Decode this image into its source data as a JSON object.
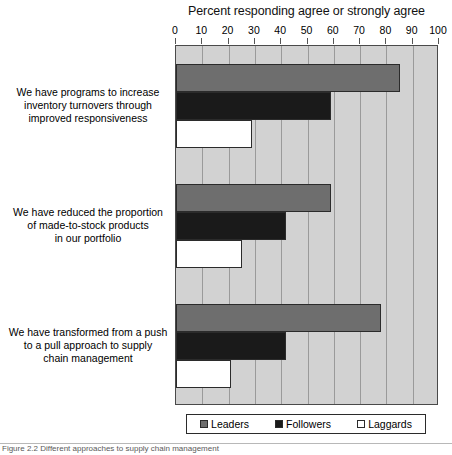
{
  "chart_data": {
    "type": "bar",
    "orientation": "horizontal",
    "title": "Percent responding agree or strongly agree",
    "xlabel": "",
    "ylabel": "",
    "xlim": [
      0,
      100
    ],
    "xticks": [
      0,
      10,
      20,
      30,
      40,
      50,
      60,
      70,
      80,
      90,
      100
    ],
    "grid": true,
    "legend_position": "bottom",
    "categories": [
      "We have programs to increase inventory turnovers through improved responsiveness",
      "We have reduced the proportion of made-to-stock products in our portfolio",
      "We have transformed from a push to a pull approach to supply chain management"
    ],
    "series": [
      {
        "name": "Leaders",
        "color": "#6e6e6e",
        "values": [
          85,
          59,
          78
        ]
      },
      {
        "name": "Followers",
        "color": "#1a1a1a",
        "values": [
          59,
          42,
          42
        ]
      },
      {
        "name": "Laggards",
        "color": "#ffffff",
        "values": [
          29,
          25,
          21
        ]
      }
    ]
  },
  "axis": {
    "ticks": [
      "0",
      "10",
      "20",
      "30",
      "40",
      "50",
      "60",
      "70",
      "80",
      "90",
      "100"
    ]
  },
  "category_labels": [
    {
      "lines": [
        "We have programs to increase",
        "inventory turnovers through",
        "improved responsiveness"
      ]
    },
    {
      "lines": [
        "We have reduced the proportion",
        "of made-to-stock products",
        "in our portfolio"
      ]
    },
    {
      "lines": [
        "We have transformed from a push",
        "to a pull approach to supply",
        "chain management"
      ]
    }
  ],
  "legend": {
    "items": [
      {
        "label": "Leaders"
      },
      {
        "label": "Followers"
      },
      {
        "label": "Laggards"
      }
    ]
  },
  "caption": {
    "text": "Figure 2.2 Different approaches to supply chain management"
  },
  "colors": {
    "leaders": "#6e6e6e",
    "followers": "#1a1a1a",
    "laggards": "#ffffff",
    "plot_background": "#d2d2d2",
    "gridline": "#9a9a9a",
    "axis": "#4a4a4a"
  }
}
